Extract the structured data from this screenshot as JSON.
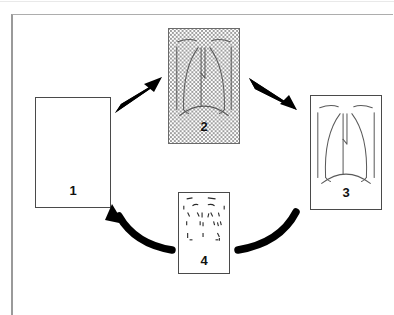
{
  "figure": {
    "type": "cycle-diagram",
    "panel_count": 4,
    "background_color": "#ffffff",
    "line_color": "#4a4a4a",
    "arrow_color": "#000000",
    "frame_color": "#9a9a9a"
  },
  "panels": [
    {
      "id": "panel-1",
      "label": "1",
      "content": "blank",
      "fill": "none",
      "description": "empty rectangle",
      "x": 35,
      "y": 97,
      "width": 76,
      "height": 111,
      "label_x_pct": 50,
      "label_bottom": 10
    },
    {
      "id": "panel-2",
      "label": "2",
      "content": "chest-radiograph-outline",
      "fill": "crosshatch",
      "description": "shaded chest radiograph with lung outlines on crosshatch ground",
      "x": 168,
      "y": 28,
      "width": 72,
      "height": 116,
      "label_x_pct": 50,
      "label_bottom": 10
    },
    {
      "id": "panel-3",
      "label": "3",
      "content": "chest-radiograph-outline",
      "fill": "none",
      "description": "clear chest radiograph with lung outlines",
      "x": 310,
      "y": 95,
      "width": 72,
      "height": 115,
      "label_x_pct": 50,
      "label_bottom": 10
    },
    {
      "id": "panel-4",
      "label": "4",
      "content": "chest-radiograph-dashed",
      "fill": "none",
      "description": "fragmented dashed chest radiograph outline",
      "x": 178,
      "y": 192,
      "width": 52,
      "height": 82,
      "label_x_pct": 50,
      "label_bottom": 6
    }
  ],
  "arrows": [
    {
      "id": "arrow-1-to-2",
      "from": "panel-1",
      "to": "panel-2",
      "style": "straight-tapered",
      "direction": "up-right",
      "color": "#000000"
    },
    {
      "id": "arrow-2-to-3",
      "from": "panel-2",
      "to": "panel-3",
      "style": "straight-tapered",
      "direction": "down-right",
      "color": "#000000"
    },
    {
      "id": "arrow-3-to-4",
      "from": "panel-3",
      "to": "panel-4",
      "style": "curved-thick",
      "direction": "down-left",
      "color": "#000000"
    },
    {
      "id": "arrow-4-to-1",
      "from": "panel-4",
      "to": "panel-1",
      "style": "curved-thick-arrowhead",
      "direction": "up-left",
      "color": "#000000"
    }
  ]
}
